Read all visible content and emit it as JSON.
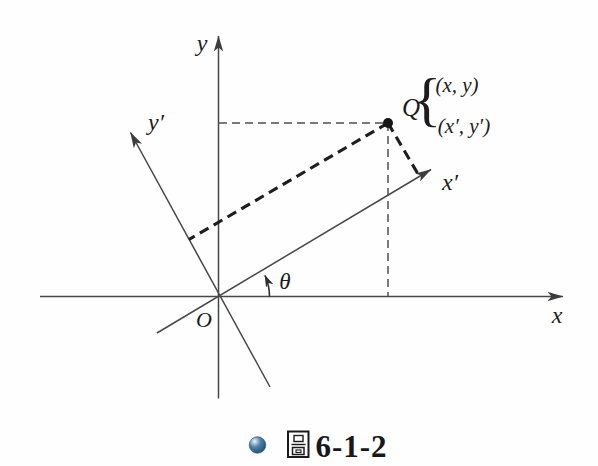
{
  "figure": {
    "axis_labels": {
      "y": "y",
      "y_prime": "y′",
      "x": "x",
      "x_prime": "x′"
    },
    "origin_label": "O",
    "angle_label": "θ",
    "point": {
      "name": "Q",
      "brace": "{",
      "coords_xy": "(x, y)",
      "coords_x_prime_y_prime": "(x′, y′)"
    },
    "caption": {
      "bullet_color": "#4d7fa9",
      "figure_char": "圖",
      "number": "6-1-2"
    }
  }
}
